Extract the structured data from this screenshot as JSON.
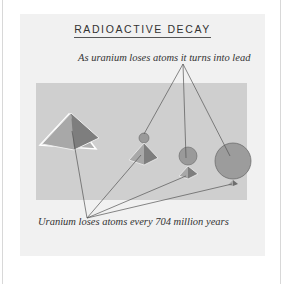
{
  "diagram": {
    "title": "RADIOACTIVE DECAY",
    "top_label": "As uranium loses atoms it turns into lead",
    "bottom_label": "Uranium loses atoms every 704 million years",
    "colors": {
      "card_bg": "#f1f1f1",
      "scene_bg": "#cfcfcf",
      "uranium_pyramid": "#a0a0a0",
      "lead_sphere": "#9a9a9a",
      "leader_lines": "#555555"
    },
    "stages": [
      {
        "name": "stage-1",
        "pyramid": "large",
        "sphere": "none"
      },
      {
        "name": "stage-2",
        "pyramid": "medium",
        "sphere": "small"
      },
      {
        "name": "stage-3",
        "pyramid": "small",
        "sphere": "medium"
      },
      {
        "name": "stage-4",
        "pyramid": "tiny",
        "sphere": "large"
      }
    ]
  }
}
